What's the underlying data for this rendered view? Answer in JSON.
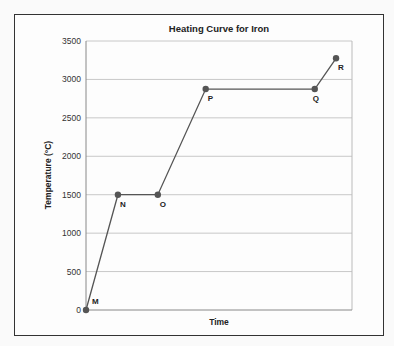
{
  "chart_data": {
    "type": "line",
    "title": "Heating Curve for Iron",
    "xlabel": "Time",
    "ylabel": "Temperature (°C)",
    "ylim": [
      0,
      3500
    ],
    "yticks": [
      0,
      500,
      1000,
      1500,
      2000,
      2500,
      3000,
      3500
    ],
    "ytick_labels": [
      "0",
      "500",
      "1000",
      "1500",
      "2000",
      "2500",
      "3000",
      "3500"
    ],
    "grid": true,
    "legend": null,
    "x_ticks_shown": false,
    "points": [
      {
        "label": "M",
        "x": 0,
        "y": 0
      },
      {
        "label": "N",
        "x": 1.2,
        "y": 1500
      },
      {
        "label": "O",
        "x": 2.7,
        "y": 1500
      },
      {
        "label": "P",
        "x": 4.5,
        "y": 2875
      },
      {
        "label": "Q",
        "x": 8.6,
        "y": 2875
      },
      {
        "label": "R",
        "x": 9.4,
        "y": 3275
      }
    ],
    "x_range": [
      0,
      10
    ]
  }
}
